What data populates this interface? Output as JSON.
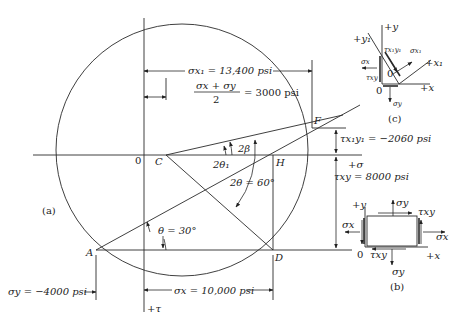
{
  "figure": {
    "panel_labels": {
      "a": "(a)",
      "b": "(b)",
      "c": "(c)"
    },
    "points": {
      "origin": "0",
      "C": "C",
      "H": "H",
      "F": "F",
      "A": "A",
      "D": "D"
    },
    "axes": {
      "sigma_positive": "+σ",
      "tau_positive": "+τ"
    },
    "annotations": {
      "sigma_x1": "σx₁ = 13,400 psi",
      "center": "(σx + σy)/2 = 3000 psi",
      "center_num": "σx + σy",
      "center_den": "2",
      "center_val": "= 3000 psi",
      "tau_x1y1": "τx₁y₁ = −2060 psi",
      "tau_xy": "τxy = 8000 psi",
      "sigma_y": "σy = −4000 psi",
      "sigma_x": "σx = 10,000 psi",
      "two_beta": "2β",
      "two_theta1": "2θ₁",
      "two_theta": "2θ = 60°",
      "theta": "θ = 30°"
    },
    "element_b": {
      "plus_y": "+y",
      "plus_x": "+x",
      "origin": "0",
      "sigma_x": "σx",
      "sigma_y": "σy",
      "tau_xy": "τxy"
    },
    "element_c": {
      "plus_y": "+y",
      "plus_x": "+x",
      "plus_y1": "+y₁",
      "plus_x1": "+x₁",
      "origin": "0",
      "origin1": "0",
      "sigma_x": "σx",
      "sigma_y": "σy",
      "tau_xy": "τxy",
      "sigma_x1": "σx₁",
      "tau_x1y1": "τx₁y₁"
    }
  }
}
